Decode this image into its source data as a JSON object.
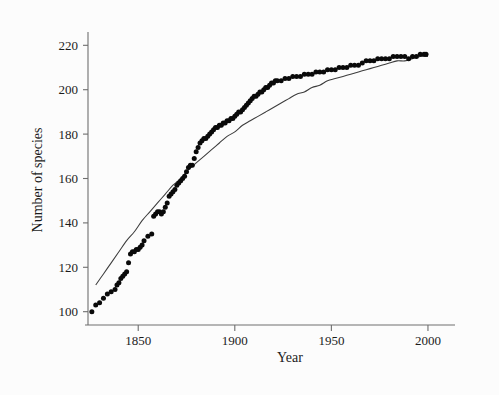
{
  "chart_data": {
    "type": "scatter",
    "title": "",
    "xlabel": "Year",
    "ylabel": "Number of species",
    "xlim": [
      1824,
      2014
    ],
    "ylim": [
      94,
      226
    ],
    "xticks": [
      1850,
      1900,
      1950,
      2000
    ],
    "yticks": [
      100,
      120,
      140,
      160,
      180,
      200,
      220
    ],
    "xtick_labels": [
      "1850",
      "1900",
      "1950",
      "2000"
    ],
    "ytick_labels": [
      "100",
      "120",
      "140",
      "160",
      "180",
      "200",
      "220"
    ],
    "grid": false,
    "legend": null,
    "marker_color": "#0a0a0a",
    "curve_color": "#3c3c3c",
    "background_color": "#fcfcfc",
    "axis_color": "#6e6e6e",
    "series": [
      {
        "name": "Observed cumulative species",
        "marker": "filled-circle",
        "x": [
          1826,
          1828,
          1830,
          1832,
          1834,
          1836,
          1838,
          1839,
          1840,
          1841,
          1842,
          1843,
          1844,
          1845,
          1846,
          1847,
          1848,
          1849,
          1850,
          1851,
          1852,
          1853,
          1855,
          1857,
          1858,
          1859,
          1860,
          1861,
          1862,
          1863,
          1864,
          1865,
          1866,
          1867,
          1868,
          1869,
          1870,
          1871,
          1872,
          1873,
          1874,
          1875,
          1876,
          1877,
          1878,
          1879,
          1880,
          1881,
          1882,
          1883,
          1884,
          1885,
          1886,
          1887,
          1888,
          1889,
          1890,
          1891,
          1892,
          1893,
          1894,
          1895,
          1896,
          1897,
          1898,
          1899,
          1900,
          1901,
          1902,
          1903,
          1904,
          1905,
          1906,
          1907,
          1908,
          1909,
          1910,
          1911,
          1912,
          1913,
          1914,
          1915,
          1916,
          1917,
          1918,
          1919,
          1920,
          1921,
          1922,
          1924,
          1926,
          1928,
          1930,
          1932,
          1934,
          1936,
          1938,
          1940,
          1942,
          1944,
          1946,
          1948,
          1950,
          1952,
          1954,
          1956,
          1958,
          1960,
          1962,
          1964,
          1966,
          1968,
          1970,
          1972,
          1974,
          1976,
          1978,
          1980,
          1982,
          1984,
          1986,
          1988,
          1990,
          1992,
          1994,
          1996,
          1998,
          1999
        ],
        "y": [
          100,
          103,
          104,
          106,
          108,
          109,
          110,
          112,
          113,
          115,
          116,
          117,
          118,
          122,
          126,
          127,
          127,
          128,
          128,
          129,
          130,
          132,
          134,
          135,
          143,
          144,
          145,
          145,
          144,
          145,
          147,
          149,
          152,
          153,
          154,
          155,
          157,
          158,
          159,
          160,
          161,
          163,
          165,
          166,
          166,
          169,
          172,
          174,
          176,
          177,
          178,
          178,
          179,
          180,
          181,
          182,
          183,
          183,
          184,
          184,
          185,
          185,
          186,
          186,
          187,
          187,
          188,
          189,
          190,
          190,
          191,
          192,
          193,
          194,
          195,
          196,
          197,
          197,
          198,
          199,
          199,
          200,
          201,
          201,
          202,
          203,
          203,
          204,
          204,
          204,
          205,
          205,
          206,
          206,
          206,
          207,
          207,
          207,
          208,
          208,
          208,
          209,
          209,
          209,
          210,
          210,
          210,
          211,
          211,
          211,
          212,
          213,
          213,
          213,
          214,
          214,
          214,
          214,
          215,
          215,
          215,
          215,
          214,
          215,
          215,
          216,
          216,
          216
        ]
      }
    ],
    "fit_curve": {
      "name": "Fitted asymptotic curve",
      "model": "asymptotic-growth",
      "x": [
        1828,
        1832,
        1836,
        1840,
        1844,
        1848,
        1852,
        1856,
        1860,
        1864,
        1868,
        1872,
        1876,
        1880,
        1884,
        1888,
        1892,
        1896,
        1900,
        1904,
        1908,
        1912,
        1916,
        1920,
        1924,
        1928,
        1932,
        1936,
        1940,
        1944,
        1948,
        1952,
        1956,
        1960,
        1964,
        1968,
        1972,
        1976,
        1980,
        1984,
        1988,
        1992,
        1996,
        2000
      ],
      "y": [
        112,
        117,
        122,
        127,
        132,
        136,
        141,
        145,
        149,
        153,
        157,
        160,
        164,
        167,
        170,
        173,
        176,
        179,
        181,
        184,
        186,
        188,
        190,
        192,
        194,
        196,
        198,
        199,
        201,
        202,
        204,
        205,
        206,
        207,
        208,
        209,
        210,
        211,
        212,
        213,
        213,
        214,
        215,
        215
      ]
    }
  }
}
